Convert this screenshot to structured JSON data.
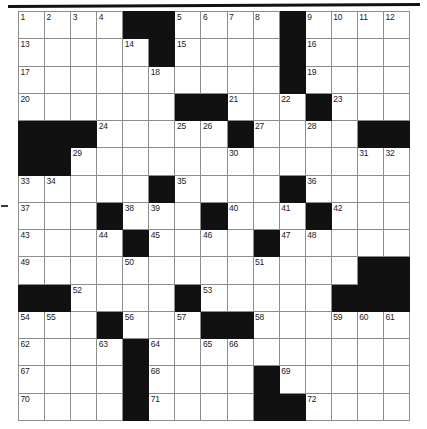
{
  "document": {
    "type": "crossword-puzzle-grid",
    "title": "Crossword Puzzle Grid",
    "grid_size": "15x15"
  },
  "decorations": {
    "top_rule": "horizontal-rule",
    "margin_mark": "scan-mark"
  },
  "crossword": {
    "rows": 15,
    "cols": 15,
    "colors": {
      "block": "#111111",
      "cell": "#ffffff",
      "grid_line": "#8d8d8d",
      "border": "#444444",
      "number_text": "#1a1a1a"
    },
    "max_clue_number": 72,
    "layout": [
      [
        "1",
        "2",
        "3",
        "4",
        "#",
        "#",
        "5",
        "6",
        "7",
        "8",
        "#",
        "9",
        "10",
        "11",
        "12"
      ],
      [
        "13",
        "",
        "",
        "",
        "14",
        "#",
        "15",
        "",
        "",
        "",
        "#",
        "16",
        "",
        "",
        ""
      ],
      [
        "17",
        "",
        "",
        "",
        "",
        "18",
        "",
        "",
        "",
        "",
        "#",
        "19",
        "",
        "",
        ""
      ],
      [
        "20",
        "",
        "",
        "",
        "",
        "",
        "#",
        "#",
        "21",
        "",
        "22",
        "#",
        "23",
        "",
        ""
      ],
      [
        "#",
        "#",
        "#",
        "24",
        "",
        "",
        "25",
        "26",
        "#",
        "27",
        "",
        "28",
        "",
        "#",
        "#"
      ],
      [
        "#",
        "#",
        "29",
        "",
        "",
        "",
        "",
        "",
        "30",
        "",
        "",
        "",
        "",
        "31",
        "32"
      ],
      [
        "33",
        "34",
        "",
        "",
        "",
        "#",
        "35",
        "",
        "",
        "",
        "#",
        "36",
        "",
        "",
        ""
      ],
      [
        "37",
        "",
        "",
        "#",
        "38",
        "39",
        "",
        "#",
        "40",
        "",
        "41",
        "#",
        "42",
        "",
        ""
      ],
      [
        "43",
        "",
        "",
        "44",
        "#",
        "45",
        "",
        "46",
        "",
        "#",
        "47",
        "48",
        "",
        "",
        ""
      ],
      [
        "49",
        "",
        "",
        "",
        "50",
        "",
        "",
        "",
        "",
        "51",
        "",
        "",
        "",
        "#",
        "#"
      ],
      [
        "#",
        "#",
        "52",
        "",
        "",
        "",
        "#",
        "53",
        "",
        "",
        "",
        "",
        "#",
        "#",
        "#"
      ],
      [
        "54",
        "55",
        "",
        "#",
        "56",
        "",
        "57",
        "#",
        "#",
        "58",
        "",
        "",
        "59",
        "60",
        "61"
      ],
      [
        "62",
        "",
        "",
        "63",
        "#",
        "64",
        "",
        "65",
        "66",
        "",
        "",
        "",
        "",
        "",
        ""
      ],
      [
        "67",
        "",
        "",
        "",
        "#",
        "68",
        "",
        "",
        "",
        "#",
        "69",
        "",
        "",
        "",
        ""
      ],
      [
        "70",
        "",
        "",
        "",
        "#",
        "71",
        "",
        "",
        "",
        "#",
        "#",
        "72",
        "",
        "",
        ""
      ]
    ]
  }
}
